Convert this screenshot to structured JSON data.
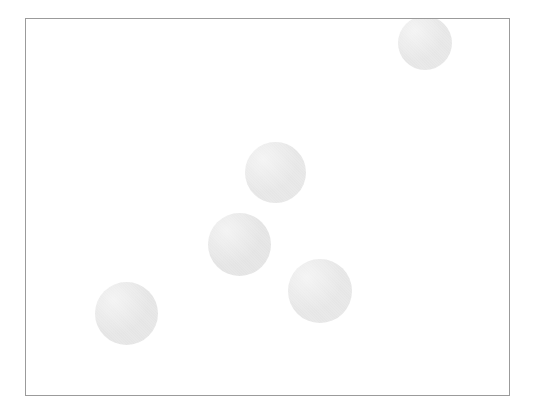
{
  "canvas": {
    "width": 534,
    "height": 415,
    "background_color": "#ffffff"
  },
  "frame": {
    "label": "plot-frame",
    "x": 25,
    "y": 18,
    "width": 485,
    "height": 378,
    "border_color": "#9b9b9b",
    "border_width": 1,
    "fill_color": "#ffffff"
  },
  "chart_data": {
    "type": "scatter",
    "title": "",
    "subtitle": "",
    "xlabel": "",
    "ylabel": "",
    "grid": false,
    "legend": "none",
    "tick_labels_x": [],
    "tick_labels_y": [],
    "annotations": [],
    "xlim": [
      25,
      510
    ],
    "ylim": [
      18,
      396
    ],
    "marker_shape": "circle",
    "marker_fill_color": "#e9e9e9",
    "marker_edge_color": "none",
    "point_count": 5,
    "units": "pixels",
    "points": [
      {
        "id": "disc-1",
        "name": "top-right-disc",
        "cx": 425,
        "cy": 43,
        "diameter": 54,
        "radius": 27,
        "clipped": true,
        "clipped_edge": "top",
        "color": "#e9e9e9"
      },
      {
        "id": "disc-2",
        "name": "upper-middle-disc",
        "cx": 275,
        "cy": 172,
        "diameter": 61,
        "radius": 30.5,
        "clipped": false,
        "clipped_edge": "none",
        "color": "#e9e9e9"
      },
      {
        "id": "disc-3",
        "name": "center-disc",
        "cx": 239,
        "cy": 244,
        "diameter": 63,
        "radius": 31.5,
        "clipped": false,
        "clipped_edge": "none",
        "color": "#e7e7e7"
      },
      {
        "id": "disc-4",
        "name": "lower-right-disc",
        "cx": 320,
        "cy": 291,
        "diameter": 64,
        "radius": 32,
        "clipped": false,
        "clipped_edge": "none",
        "color": "#e9e9e9"
      },
      {
        "id": "disc-5",
        "name": "lower-left-disc",
        "cx": 126,
        "cy": 313,
        "diameter": 63,
        "radius": 31.5,
        "clipped": false,
        "clipped_edge": "none",
        "color": "#e8e8e8"
      }
    ]
  }
}
